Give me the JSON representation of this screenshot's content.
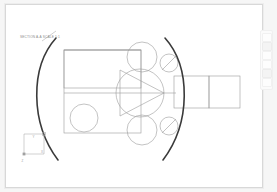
{
  "app": {
    "name": "cad-sketch-viewer",
    "sheet_background": "#ffffff",
    "workspace_background": "#f6f6f6",
    "sheet_border_color": "#d8d8d8"
  },
  "annotation": {
    "label": "SECTION A-A SCALE 1:1",
    "leader_line": "diagonal leader to arc",
    "color": "#8b8b8b"
  },
  "coordinate_triad": {
    "name": "origin-triad",
    "y_axis": "Y",
    "x_axis": "X",
    "z_axis": "Z",
    "color": "#a0a0a0"
  },
  "tool_palette": {
    "name": "vertical-tool-palette",
    "buttons": [
      {
        "name": "tool-select",
        "active": false
      },
      {
        "name": "tool-line",
        "active": true
      },
      {
        "name": "tool-circle",
        "active": false
      },
      {
        "name": "tool-arc",
        "active": false
      },
      {
        "name": "tool-dimension",
        "active": true
      },
      {
        "name": "tool-trim",
        "active": false
      }
    ]
  },
  "geometry": {
    "stroke_color": "#9a9a9a",
    "accent_stroke_color": "#3a3a3a",
    "stroke_width": 0.6,
    "arc_stroke_width": 1.6,
    "rectangles": [
      {
        "name": "outer-body-rect",
        "x": 58,
        "y": 45,
        "w": 77,
        "h": 83
      },
      {
        "name": "upper-band-rect",
        "x": 58,
        "y": 45,
        "w": 77,
        "h": 38
      },
      {
        "name": "shaft-rect-left",
        "x": 168,
        "y": 71,
        "w": 35,
        "h": 32
      },
      {
        "name": "shaft-rect-right",
        "x": 203,
        "y": 71,
        "w": 31,
        "h": 32
      }
    ],
    "circles": [
      {
        "name": "center-large-circle",
        "cx": 134,
        "cy": 88,
        "r": 24
      },
      {
        "name": "top-circle",
        "cx": 136,
        "cy": 52,
        "r": 15
      },
      {
        "name": "bottom-circle",
        "cx": 136,
        "cy": 125,
        "r": 15
      },
      {
        "name": "left-circle",
        "cx": 78,
        "cy": 113,
        "r": 14
      },
      {
        "name": "top-small-circle",
        "cx": 163,
        "cy": 58,
        "r": 9
      },
      {
        "name": "bottom-small-circle",
        "cx": 163,
        "cy": 121,
        "r": 9
      }
    ],
    "triangle": {
      "name": "inscribed-triangle",
      "points": "114,65 114,111 158,88"
    },
    "arcs": [
      {
        "name": "left-major-arc",
        "d": "M 50,33 C 24,62 24,118 52,155"
      },
      {
        "name": "right-major-arc",
        "d": "M 159,33 C 185,62 185,118 157,155"
      }
    ],
    "centerlines": [
      {
        "name": "horizontal-centerline",
        "x1": 58,
        "y1": 88,
        "x2": 170,
        "y2": 88
      },
      {
        "name": "upper-horizontal-line",
        "x1": 58,
        "y1": 45,
        "x2": 135,
        "y2": 45
      }
    ],
    "slash_lines": [
      {
        "name": "top-small-circle-slash",
        "x1": 156,
        "y1": 65,
        "x2": 170,
        "y2": 51
      },
      {
        "name": "bottom-small-circle-slash",
        "x1": 156,
        "y1": 128,
        "x2": 170,
        "y2": 114
      }
    ]
  }
}
